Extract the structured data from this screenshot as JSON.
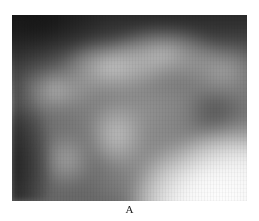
{
  "figure": {
    "panel_label": "A",
    "image_description": "grayscale radiographic image with soft tissue density",
    "tones": {
      "background": "#ffffff",
      "darkest": "#1a1a1a",
      "midtone": "#8c8c8c",
      "brightest": "#fafafa",
      "label_color": "#222222"
    }
  }
}
